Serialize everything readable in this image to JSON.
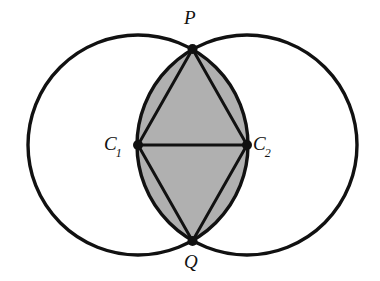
{
  "figure": {
    "background_color": "#ffffff",
    "stroke_color": "#111111",
    "lens_fill_color": "#b0b0b0",
    "width": 380,
    "height": 281
  },
  "labels": {
    "p": {
      "text": "P",
      "sub": ""
    },
    "q": {
      "text": "Q",
      "sub": ""
    },
    "c1": {
      "text": "C",
      "sub": "1"
    },
    "c2": {
      "text": "C",
      "sub": "2"
    }
  },
  "chart_data": {
    "type": "diagram",
    "circles": [
      {
        "name": "circle-left",
        "center_label": "C1",
        "cx": 138,
        "cy": 145,
        "r": 110
      },
      {
        "name": "circle-right",
        "center_label": "C2",
        "cx": 247,
        "cy": 145,
        "r": 110
      }
    ],
    "points": [
      {
        "label": "P",
        "x": 192.5,
        "y": 49,
        "role": "upper intersection of circles"
      },
      {
        "label": "Q",
        "x": 192.5,
        "y": 241,
        "role": "lower intersection of circles"
      },
      {
        "label": "C1",
        "x": 138,
        "y": 145,
        "role": "center of left circle"
      },
      {
        "label": "C2",
        "x": 247,
        "y": 145,
        "role": "center of right circle"
      }
    ],
    "segments": [
      {
        "from": "C1",
        "to": "P"
      },
      {
        "from": "P",
        "to": "C2"
      },
      {
        "from": "C2",
        "to": "Q"
      },
      {
        "from": "Q",
        "to": "C1"
      },
      {
        "from": "C1",
        "to": "C2"
      }
    ],
    "shaded_region": {
      "name": "lens",
      "vertices": [
        "P",
        "Q"
      ],
      "fill": "#b0b0b0",
      "note": "region common to both circles"
    },
    "axis_ranges": {
      "x": [
        0,
        380
      ],
      "y": [
        0,
        281
      ]
    },
    "grid": false,
    "legend": "none"
  }
}
